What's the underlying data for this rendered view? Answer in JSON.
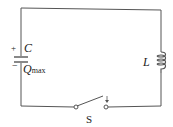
{
  "diagram": {
    "capacitor_label": "C",
    "charge_label": "Q",
    "charge_subscript": "max",
    "plus_sign": "+",
    "minus_sign": "−",
    "inductor_label": "L",
    "switch_label": "S",
    "wire_color": "#555555"
  }
}
